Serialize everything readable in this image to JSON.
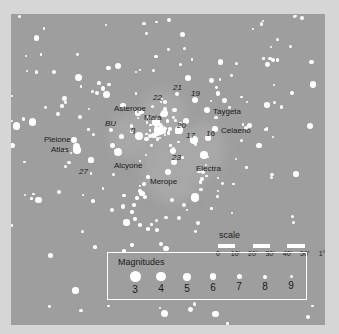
{
  "chart_data": {
    "type": "scatter",
    "xlabel": "",
    "ylabel": "",
    "background_color": "#9e9e9e",
    "star_color": "#ffffff",
    "label_color": "#1a1a1a",
    "named_stars": [
      {
        "label": "Pleione",
        "x": 63,
        "y": 126,
        "mag": 5.0,
        "style": "roman"
      },
      {
        "label": "Atlas",
        "x": 66,
        "y": 136,
        "mag": 3.6,
        "style": "roman"
      },
      {
        "label": "27",
        "x": 80,
        "y": 146,
        "mag": 5.5,
        "style": "italic"
      },
      {
        "label": "BU",
        "x": 100,
        "y": 116,
        "mag": 6.0,
        "style": "italic"
      },
      {
        "label": "Alcyone",
        "x": 107,
        "y": 138,
        "mag": 2.9,
        "style": "roman"
      },
      {
        "label": "η",
        "x": 128,
        "y": 122,
        "mag": 2.9,
        "style": "italic"
      },
      {
        "label": "Asterope",
        "x": 127,
        "y": 99,
        "mag": 5.6,
        "style": "roman"
      },
      {
        "label": "Maia",
        "x": 145,
        "y": 108,
        "mag": 3.9,
        "style": "roman"
      },
      {
        "label": "22",
        "x": 154,
        "y": 88,
        "mag": 6.4,
        "style": "italic"
      },
      {
        "label": "21",
        "x": 166,
        "y": 80,
        "mag": 5.8,
        "style": "italic"
      },
      {
        "label": "20",
        "x": 168,
        "y": 116,
        "mag": 3.9,
        "style": "italic"
      },
      {
        "label": "19",
        "x": 184,
        "y": 86,
        "mag": 4.3,
        "style": "italic"
      },
      {
        "label": "Taygeta",
        "x": 196,
        "y": 96,
        "mag": 4.3,
        "style": "roman"
      },
      {
        "label": "Celaeno",
        "x": 204,
        "y": 115,
        "mag": 5.4,
        "style": "roman"
      },
      {
        "label": "16",
        "x": 197,
        "y": 124,
        "mag": 5.4,
        "style": "italic"
      },
      {
        "label": "17",
        "x": 183,
        "y": 126,
        "mag": 3.7,
        "style": "italic"
      },
      {
        "label": "Electra",
        "x": 193,
        "y": 141,
        "mag": 3.7,
        "style": "roman"
      },
      {
        "label": "23",
        "x": 163,
        "y": 148,
        "mag": 4.2,
        "style": "italic"
      },
      {
        "label": "Merope",
        "x": 157,
        "y": 158,
        "mag": 4.2,
        "style": "roman"
      }
    ]
  },
  "scale": {
    "title": "scale",
    "ticks": [
      "0",
      "10'",
      "20'",
      "30'",
      "40'",
      "50'",
      "1°"
    ],
    "segments": 6
  },
  "magnitudes": {
    "title": "Magnitudes",
    "values": [
      "3",
      "4",
      "5",
      "6",
      "7",
      "8",
      "9"
    ],
    "dot_sizes_px": [
      11,
      9.5,
      8,
      6.5,
      5,
      4,
      3
    ]
  }
}
